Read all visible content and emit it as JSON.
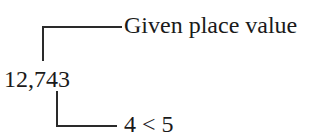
{
  "diagram": {
    "number": "12,743",
    "top_label": "Given place value",
    "bottom_label": "4 < 5",
    "line_color": "#2a2a2a",
    "text_color": "#1a1a1a"
  }
}
